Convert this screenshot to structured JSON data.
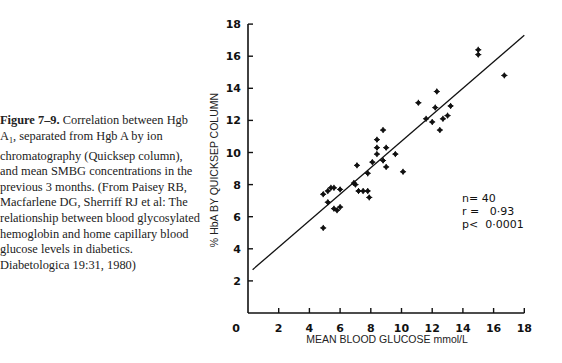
{
  "caption": {
    "figure_label": "Figure 7–9.",
    "text_part1": " Correlation between Hgb A",
    "subscript": "1",
    "text_part2": ", separated from Hgb A by ion chromatography (Quicksep column), and mean SMBG concentrations in the previous 3 months. (From Paisey RB, Macfarlene DG, Sherriff RJ et al: The relationship between blood glycosylated hemoglobin and home capillary blood glucose levels in diabetics. Diabetologica 19:31, 1980)"
  },
  "chart_data": {
    "type": "scatter",
    "title": "",
    "xlabel": "MEAN BLOOD GLUCOSE mmol/L",
    "ylabel": "% HbA BY QUICKSEP COLUMN",
    "xlim": [
      0,
      18
    ],
    "ylim": [
      0,
      18
    ],
    "x_ticks": [
      0,
      2,
      4,
      6,
      8,
      10,
      12,
      14,
      16,
      18
    ],
    "y_ticks": [
      2,
      4,
      6,
      8,
      10,
      12,
      14,
      16,
      18
    ],
    "grid": false,
    "legend": null,
    "points": [
      [
        4.9,
        7.4
      ],
      [
        5.2,
        7.6
      ],
      [
        5.4,
        7.8
      ],
      [
        5.6,
        7.8
      ],
      [
        6.0,
        7.7
      ],
      [
        5.2,
        6.9
      ],
      [
        5.6,
        6.5
      ],
      [
        5.8,
        6.4
      ],
      [
        6.0,
        6.6
      ],
      [
        4.9,
        5.3
      ],
      [
        7.0,
        8.0
      ],
      [
        7.2,
        7.6
      ],
      [
        6.9,
        8.1
      ],
      [
        7.1,
        9.2
      ],
      [
        7.5,
        7.6
      ],
      [
        7.8,
        7.6
      ],
      [
        7.9,
        7.2
      ],
      [
        7.8,
        8.7
      ],
      [
        8.1,
        9.4
      ],
      [
        8.4,
        10.8
      ],
      [
        8.4,
        10.3
      ],
      [
        8.4,
        9.9
      ],
      [
        8.8,
        9.5
      ],
      [
        9.0,
        10.3
      ],
      [
        9.0,
        9.1
      ],
      [
        9.6,
        9.9
      ],
      [
        10.1,
        8.8
      ],
      [
        8.8,
        11.4
      ],
      [
        11.1,
        13.1
      ],
      [
        11.6,
        12.1
      ],
      [
        12.0,
        11.9
      ],
      [
        12.2,
        12.8
      ],
      [
        12.3,
        13.8
      ],
      [
        12.5,
        11.4
      ],
      [
        12.7,
        12.1
      ],
      [
        13.0,
        12.3
      ],
      [
        13.2,
        12.9
      ],
      [
        15.0,
        16.4
      ],
      [
        15.0,
        16.1
      ],
      [
        16.7,
        14.8
      ]
    ],
    "regression_line": {
      "x": [
        0.3,
        18
      ],
      "y": [
        2.7,
        17.3
      ]
    },
    "annotations": [
      {
        "text": "n= 40"
      },
      {
        "text": "r =   0·93"
      },
      {
        "text": "p<  0·0001"
      }
    ]
  }
}
